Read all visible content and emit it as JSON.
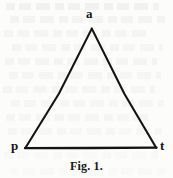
{
  "figure": {
    "caption": "Fig. 1.",
    "background_color": "#fcfcfb",
    "stroke_color": "#141414",
    "label_color": "#171717",
    "vertices": [
      {
        "id": "apex",
        "label": "a",
        "x": 92,
        "y": 28
      },
      {
        "id": "bottom-left",
        "label": "p",
        "x": 25,
        "y": 148
      },
      {
        "id": "bottom-right",
        "label": "t",
        "x": 156,
        "y": 148
      }
    ],
    "edges": [
      {
        "id": "edge-p-a",
        "from": "bottom-left",
        "to": "apex"
      },
      {
        "id": "edge-a-t",
        "from": "apex",
        "to": "bottom-right"
      },
      {
        "id": "edge-p-t",
        "from": "bottom-left",
        "to": "bottom-right"
      }
    ]
  }
}
